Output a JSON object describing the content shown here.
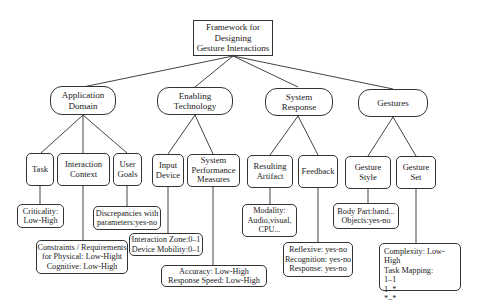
{
  "diagram": {
    "type": "tree",
    "root": {
      "label": "Framework for\nDesigning\nGesture Interactions"
    },
    "categories": [
      {
        "label": "Application\nDomain",
        "children": [
          {
            "label": "Task",
            "attribute": "Criticality:\nLow-High"
          },
          {
            "label": "Interaction\nContext",
            "attribute": "Constraints / Requirements\nfor Physical: Low-Hight\nCognitive: Low-High"
          },
          {
            "label": "User\nGoals",
            "attribute": "Discrepancies with\nparameters:yes-no"
          }
        ]
      },
      {
        "label": "Enabling\nTechnology",
        "children": [
          {
            "label": "Input\nDevice",
            "attribute": "Interaction Zone:0–1\nDevice Mobility:0–1"
          },
          {
            "label": "System\nPerformance\nMeasures",
            "attribute": "Accuracy: Low-High\nResponse Speed: Low-High"
          }
        ]
      },
      {
        "label": "System\nResponse",
        "children": [
          {
            "label": "Resulting\nArtifact",
            "attribute": "Modality:\nAudio,visual,\nCPU..."
          },
          {
            "label": "Feedback",
            "attribute": "Reflexive: yes-no\nRecognition: yes-no\nResponse: yes-no"
          }
        ]
      },
      {
        "label": "Gestures",
        "children": [
          {
            "label": "Gesture\nStyle",
            "attribute": "Body Part:hand...\nObjects:yes-no"
          },
          {
            "label": "Gesture\nSet",
            "attribute": "Complexity: Low-High\nTask Mapping:\n1–1\n1–*\n*–*"
          }
        ]
      }
    ],
    "colors": {
      "stroke": "#333333",
      "background": "#ffffff",
      "text": "#222222"
    }
  }
}
